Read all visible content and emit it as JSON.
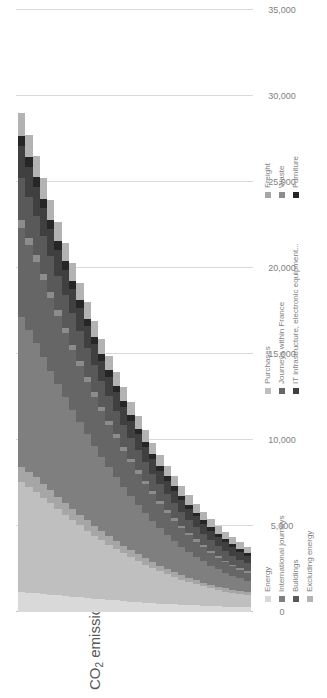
{
  "chart_data": {
    "type": "bar",
    "orientation": "horizontal-stacked-rotated",
    "title": "CO2 emissions (t)",
    "title_main": "CO",
    "title_sub": "2",
    "title_rest": " emissions (t)",
    "xlabel": "",
    "ylabel": "",
    "ylim": [
      0,
      35000
    ],
    "grid": true,
    "legend_position": "bottom",
    "tick_labels": [
      "35,000",
      "30,000",
      "25,000",
      "20,000",
      "15,000",
      "10,000",
      "5,000",
      "0"
    ],
    "tick_values": [
      35000,
      30000,
      25000,
      20000,
      15000,
      10000,
      5000,
      0
    ],
    "categories": [
      "2019",
      "2020",
      "2021",
      "2022",
      "2023",
      "2024",
      "2025",
      "2026",
      "2027",
      "2028",
      "2029",
      "2030",
      "2031",
      "2032",
      "2033",
      "2034",
      "2035",
      "2036",
      "2037",
      "2038",
      "2039",
      "2040",
      "2041",
      "2042",
      "2043",
      "2044",
      "2045",
      "2046",
      "2047",
      "2048",
      "2049",
      "2050"
    ],
    "series": [
      {
        "name": "Energy",
        "color": "#d9d9d9",
        "values": [
          1150,
          1120,
          1090,
          1050,
          1010,
          970,
          930,
          890,
          850,
          810,
          770,
          730,
          700,
          670,
          640,
          610,
          580,
          550,
          520,
          490,
          470,
          450,
          430,
          410,
          390,
          370,
          350,
          330,
          310,
          295,
          280,
          265
        ]
      },
      {
        "name": "Purchases",
        "color": "#bfbfbf",
        "values": [
          6400,
          6150,
          5900,
          5600,
          5300,
          5000,
          4720,
          4450,
          4180,
          3920,
          3670,
          3430,
          3200,
          2980,
          2770,
          2570,
          2380,
          2200,
          2030,
          1870,
          1720,
          1580,
          1450,
          1330,
          1220,
          1120,
          1030,
          950,
          880,
          820,
          770,
          730
        ]
      },
      {
        "name": "Freight",
        "color": "#a6a6a6",
        "values": [
          900,
          870,
          840,
          805,
          770,
          735,
          700,
          665,
          630,
          598,
          566,
          535,
          505,
          477,
          450,
          424,
          399,
          375,
          352,
          330,
          310,
          291,
          273,
          256,
          240,
          225,
          211,
          198,
          186,
          175,
          165,
          156
        ]
      },
      {
        "name": "International journeys",
        "color": "#7f7f7f",
        "values": [
          8700,
          8250,
          7820,
          7380,
          6950,
          6530,
          6130,
          5740,
          5360,
          5000,
          4650,
          4320,
          4000,
          3700,
          3410,
          3140,
          2880,
          2640,
          2410,
          2200,
          2000,
          1820,
          1650,
          1500,
          1360,
          1230,
          1110,
          1000,
          905,
          820,
          745,
          680
        ]
      },
      {
        "name": "Journeys within France",
        "color": "#666666",
        "values": [
          5200,
          4950,
          4700,
          4450,
          4200,
          3960,
          3720,
          3490,
          3270,
          3060,
          2860,
          2660,
          2470,
          2290,
          2120,
          1960,
          1810,
          1660,
          1530,
          1400,
          1280,
          1170,
          1070,
          975,
          890,
          810,
          740,
          675,
          615,
          560,
          510,
          465
        ]
      },
      {
        "name": "Waste",
        "color": "#8c8c8c",
        "values": [
          420,
          405,
          390,
          375,
          360,
          345,
          330,
          315,
          300,
          286,
          272,
          258,
          245,
          232,
          220,
          208,
          197,
          186,
          175,
          165,
          156,
          147,
          138,
          130,
          123,
          116,
          109,
          103,
          97,
          91,
          86,
          81
        ]
      },
      {
        "name": "Buildings",
        "color": "#595959",
        "values": [
          2450,
          2360,
          2270,
          2180,
          2090,
          2000,
          1915,
          1830,
          1745,
          1665,
          1585,
          1510,
          1435,
          1360,
          1290,
          1225,
          1160,
          1095,
          1035,
          975,
          920,
          865,
          815,
          765,
          720,
          675,
          635,
          595,
          560,
          525,
          492,
          462
        ]
      },
      {
        "name": "IT infrastructure, electronic equipment...",
        "color": "#404040",
        "values": [
          1850,
          1780,
          1710,
          1645,
          1580,
          1515,
          1455,
          1395,
          1335,
          1280,
          1225,
          1170,
          1118,
          1068,
          1020,
          972,
          927,
          883,
          840,
          799,
          760,
          722,
          686,
          651,
          617,
          585,
          554,
          524,
          496,
          469,
          443,
          418
        ]
      },
      {
        "name": "Furniture",
        "color": "#262626",
        "values": [
          620,
          598,
          576,
          555,
          534,
          513,
          494,
          474,
          455,
          437,
          419,
          402,
          385,
          369,
          353,
          338,
          323,
          309,
          295,
          282,
          269,
          257,
          245,
          234,
          223,
          213,
          203,
          193,
          184,
          175,
          167,
          159
        ]
      },
      {
        "name": "Excluding energy",
        "color": "#b3b3b3",
        "values": [
          1310,
          1270,
          1230,
          1190,
          1150,
          1110,
          1070,
          1030,
          995,
          958,
          922,
          888,
          854,
          821,
          790,
          759,
          729,
          700,
          672,
          645,
          619,
          594,
          569,
          546,
          523,
          501,
          480,
          460,
          440,
          421,
          403,
          386
        ]
      }
    ],
    "legend_columns": [
      [
        "Energy",
        "International journeys",
        "Buildings",
        "Excluding energy"
      ],
      [
        "Purchases",
        "Journeys within France",
        "IT infrastructure, electronic equipment..."
      ],
      [
        "Freight",
        "Waste",
        "Furniture"
      ]
    ]
  }
}
